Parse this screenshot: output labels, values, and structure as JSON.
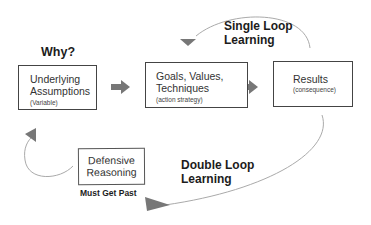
{
  "diagram": {
    "why_label": "Why?",
    "nodes": [
      {
        "id": "assumptions",
        "title_line1": "Underlying",
        "title_line2": "Assumptions",
        "subtitle": "(Variable)"
      },
      {
        "id": "strategies",
        "title_line1": "Goals, Values,",
        "title_line2": "Techniques",
        "subtitle": "(action strategy)"
      },
      {
        "id": "results",
        "title_line1": "Results",
        "subtitle": "(consequence)"
      },
      {
        "id": "defensive",
        "title_line1": "Defensive",
        "title_line2": "Reasoning"
      }
    ],
    "single_loop": {
      "line1": "Single Loop",
      "line2": "Learning"
    },
    "double_loop": {
      "line1": "Double Loop",
      "line2": "Learning"
    },
    "must_get_past": "Must Get Past",
    "colors": {
      "arrow": "#777777",
      "curve": "#aaaaaa",
      "box_border": "#444444",
      "text": "#222222"
    }
  }
}
